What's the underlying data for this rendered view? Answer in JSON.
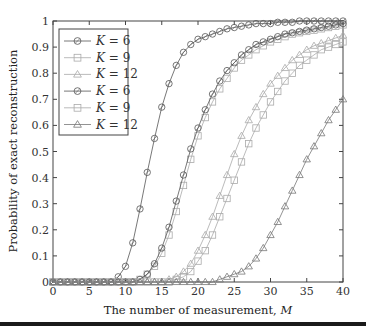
{
  "chart_data": {
    "type": "line",
    "title": "",
    "xlabel": "The number of measurement, M",
    "ylabel": "Probability of exact reconstruction",
    "xlim": [
      0,
      40
    ],
    "ylim": [
      0,
      1
    ],
    "xticks": [
      0,
      5,
      10,
      15,
      20,
      25,
      30,
      35,
      40
    ],
    "yticks": [
      0,
      0.1,
      0.2,
      0.3,
      0.4,
      0.5,
      0.6,
      0.7,
      0.8,
      0.9,
      1
    ],
    "ytick_labels": [
      "0",
      "0.1",
      "0.2",
      "0.3",
      "0.4",
      "0.5",
      "0.6",
      "0.7",
      "0.8",
      "0.9",
      "1"
    ],
    "grid": false,
    "legend_position": "upper left",
    "x": [
      1,
      2,
      3,
      4,
      5,
      6,
      7,
      8,
      9,
      10,
      11,
      12,
      13,
      14,
      15,
      16,
      17,
      18,
      19,
      20,
      21,
      22,
      23,
      24,
      25,
      26,
      27,
      28,
      29,
      30,
      31,
      32,
      33,
      34,
      35,
      36,
      37,
      38,
      39,
      40
    ],
    "series": [
      {
        "name": "K = 6",
        "marker": "circle",
        "color": "#555555",
        "values": [
          0,
          0,
          0,
          0,
          0,
          0,
          0,
          0,
          0.02,
          0.06,
          0.15,
          0.28,
          0.42,
          0.55,
          0.67,
          0.76,
          0.83,
          0.88,
          0.91,
          0.93,
          0.94,
          0.95,
          0.96,
          0.97,
          0.975,
          0.98,
          0.985,
          0.99,
          0.99,
          0.99,
          0.995,
          0.995,
          0.995,
          1,
          1,
          1,
          1,
          1,
          1,
          1
        ]
      },
      {
        "name": "K = 9",
        "marker": "square",
        "color": "#aaaaaa",
        "values": [
          0,
          0,
          0,
          0,
          0,
          0,
          0,
          0,
          0,
          0,
          0,
          0.01,
          0.03,
          0.06,
          0.11,
          0.18,
          0.27,
          0.37,
          0.47,
          0.56,
          0.63,
          0.69,
          0.74,
          0.78,
          0.82,
          0.85,
          0.87,
          0.89,
          0.905,
          0.92,
          0.93,
          0.94,
          0.95,
          0.955,
          0.96,
          0.965,
          0.97,
          0.975,
          0.98,
          0.985
        ]
      },
      {
        "name": "K = 12",
        "marker": "triangle",
        "color": "#aaaaaa",
        "values": [
          0,
          0,
          0,
          0,
          0,
          0,
          0,
          0,
          0,
          0,
          0,
          0,
          0,
          0,
          0,
          0.01,
          0.02,
          0.04,
          0.07,
          0.12,
          0.18,
          0.25,
          0.33,
          0.41,
          0.49,
          0.56,
          0.62,
          0.67,
          0.72,
          0.76,
          0.79,
          0.82,
          0.85,
          0.87,
          0.89,
          0.905,
          0.915,
          0.925,
          0.935,
          0.945
        ]
      },
      {
        "name": "K = 6",
        "marker": "circle",
        "color": "#555555",
        "values": [
          0,
          0,
          0,
          0,
          0,
          0,
          0,
          0,
          0,
          0,
          0,
          0.01,
          0.03,
          0.07,
          0.13,
          0.21,
          0.31,
          0.41,
          0.51,
          0.59,
          0.66,
          0.72,
          0.77,
          0.81,
          0.84,
          0.87,
          0.89,
          0.91,
          0.92,
          0.93,
          0.94,
          0.95,
          0.955,
          0.96,
          0.965,
          0.97,
          0.975,
          0.98,
          0.985,
          0.99
        ]
      },
      {
        "name": "K = 9",
        "marker": "square",
        "color": "#aaaaaa",
        "values": [
          0,
          0,
          0,
          0,
          0,
          0,
          0,
          0,
          0,
          0,
          0,
          0,
          0,
          0,
          0,
          0,
          0.01,
          0.02,
          0.04,
          0.08,
          0.12,
          0.18,
          0.25,
          0.32,
          0.39,
          0.46,
          0.53,
          0.59,
          0.64,
          0.69,
          0.73,
          0.77,
          0.8,
          0.83,
          0.85,
          0.87,
          0.89,
          0.9,
          0.91,
          0.92
        ]
      },
      {
        "name": "K = 12",
        "marker": "triangle",
        "color": "#777777",
        "values": [
          0,
          0,
          0,
          0,
          0,
          0,
          0,
          0,
          0,
          0,
          0,
          0,
          0,
          0,
          0,
          0,
          0,
          0,
          0,
          0,
          0,
          0,
          0.01,
          0.02,
          0.03,
          0.04,
          0.06,
          0.09,
          0.13,
          0.18,
          0.23,
          0.29,
          0.35,
          0.41,
          0.47,
          0.52,
          0.57,
          0.62,
          0.66,
          0.7
        ]
      }
    ]
  },
  "legend": {
    "items": [
      {
        "label": "K = 6",
        "marker": "circle"
      },
      {
        "label": "K = 9",
        "marker": "square"
      },
      {
        "label": "K = 12",
        "marker": "triangle"
      },
      {
        "label": "K = 6",
        "marker": "circle"
      },
      {
        "label": "K = 9",
        "marker": "square"
      },
      {
        "label": "K = 12",
        "marker": "triangle"
      }
    ]
  }
}
